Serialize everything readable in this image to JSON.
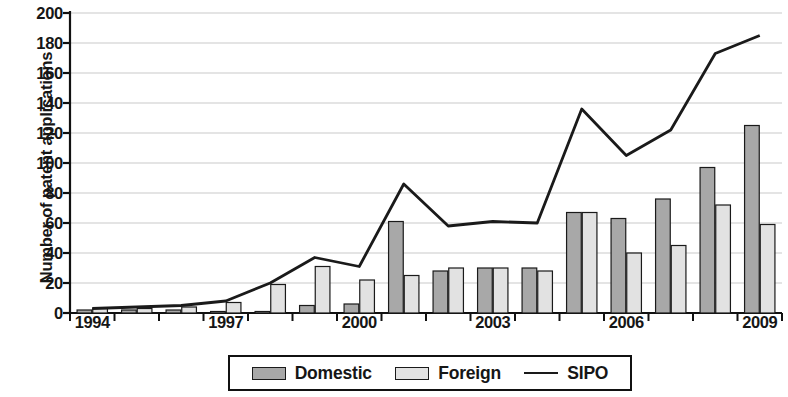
{
  "chart_data": {
    "type": "bar",
    "title": "",
    "xlabel": "",
    "ylabel": "Number of patent applications",
    "ylim": [
      0,
      200
    ],
    "ytick_step": 20,
    "yticks": [
      "200",
      "180",
      "160",
      "140",
      "120",
      "100",
      "80",
      "60",
      "40",
      "20",
      "0"
    ],
    "grid": true,
    "legend_position": "bottom-center",
    "categories": [
      "1994",
      "1995",
      "1996",
      "1997",
      "1998",
      "1999",
      "2000",
      "2001",
      "2002",
      "2003",
      "2004",
      "2005",
      "2006",
      "2007",
      "2008",
      "2009"
    ],
    "xtick_labels_shown": [
      "1994",
      "1997",
      "2000",
      "2003",
      "2006",
      "2009"
    ],
    "series": [
      {
        "name": "Domestic",
        "kind": "bar",
        "color": "#a8a8a8",
        "values": [
          2,
          2,
          2,
          1,
          1,
          5,
          6,
          61,
          28,
          30,
          30,
          67,
          63,
          76,
          97,
          125
        ]
      },
      {
        "name": "Foreign",
        "kind": "bar",
        "color": "#e2e2e2",
        "values": [
          3,
          3,
          4,
          7,
          19,
          31,
          22,
          25,
          30,
          30,
          28,
          67,
          40,
          45,
          72,
          59
        ]
      },
      {
        "name": "SIPO",
        "kind": "line",
        "color": "#1a1a1a",
        "values": [
          3,
          4,
          5,
          8,
          20,
          37,
          31,
          86,
          58,
          61,
          60,
          136,
          105,
          122,
          173,
          185
        ]
      }
    ]
  },
  "legend": {
    "items": [
      {
        "label": "Domestic",
        "marker": "bar-swatch-dark"
      },
      {
        "label": "Foreign",
        "marker": "bar-swatch-light"
      },
      {
        "label": "SIPO",
        "marker": "line-swatch"
      }
    ]
  }
}
